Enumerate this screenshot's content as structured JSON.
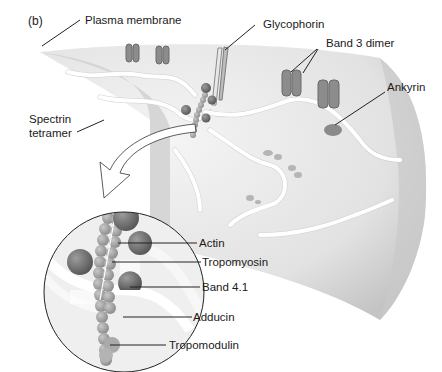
{
  "figure": {
    "panel_label": "(b)",
    "labels": {
      "plasma_membrane": "Plasma membrane",
      "glycophorin": "Glycophorin",
      "band3_dimer": "Band 3 dimer",
      "ankyrin": "Ankyrin",
      "spectrin_line1": "Spectrin",
      "spectrin_line2": "tetramer",
      "actin": "Actin",
      "tropomyosin": "Tropomyosin",
      "band41": "Band 4.1",
      "adducin": "Adducin",
      "tropomodulin": "Tropomodulin"
    },
    "colors": {
      "membrane": "#e6e6e6",
      "membrane_shadow": "#bdbdbd",
      "protein_dark": "#6e6e6e",
      "protein_mid": "#9a9a9a",
      "spectrin": "#f3f3f3",
      "leader": "#222222"
    }
  }
}
